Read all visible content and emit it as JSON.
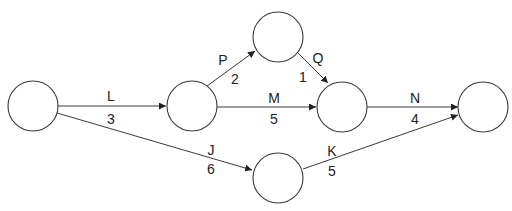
{
  "diagram": {
    "type": "activity-on-arrow network",
    "nodes": [
      {
        "id": "n1",
        "cx": 33,
        "cy": 106,
        "r": 25
      },
      {
        "id": "n2",
        "cx": 192,
        "cy": 106,
        "r": 25
      },
      {
        "id": "n3",
        "cx": 278,
        "cy": 37,
        "r": 25
      },
      {
        "id": "n4",
        "cx": 342,
        "cy": 107,
        "r": 25
      },
      {
        "id": "n5",
        "cx": 483,
        "cy": 107,
        "r": 25
      },
      {
        "id": "n6",
        "cx": 278,
        "cy": 178,
        "r": 25
      }
    ],
    "edges": [
      {
        "activity": "L",
        "duration": "3",
        "from": "n1",
        "to": "n2"
      },
      {
        "activity": "J",
        "duration": "6",
        "from": "n1",
        "to": "n6"
      },
      {
        "activity": "P",
        "duration": "2",
        "from": "n2",
        "to": "n3"
      },
      {
        "activity": "M",
        "duration": "5",
        "from": "n2",
        "to": "n4"
      },
      {
        "activity": "Q",
        "duration": "1",
        "from": "n3",
        "to": "n4"
      },
      {
        "activity": "N",
        "duration": "4",
        "from": "n4",
        "to": "n5"
      },
      {
        "activity": "K",
        "duration": "5",
        "from": "n6",
        "to": "n5"
      }
    ]
  }
}
